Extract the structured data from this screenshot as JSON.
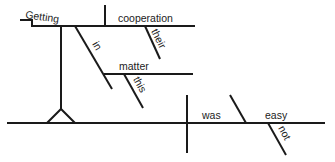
{
  "diagram": {
    "type": "Reed-Kellogg sentence diagram",
    "sentence_words": {
      "gerund": "Getting",
      "gerund_object": "cooperation",
      "object_modifier": "their",
      "preposition": "in",
      "prep_object": "matter",
      "prep_object_modifier": "this",
      "verb": "was",
      "complement": "easy",
      "complement_modifier": "not"
    },
    "colors": {
      "line": "#1a1a1a",
      "text": "#222222",
      "background": "#ffffff"
    }
  }
}
